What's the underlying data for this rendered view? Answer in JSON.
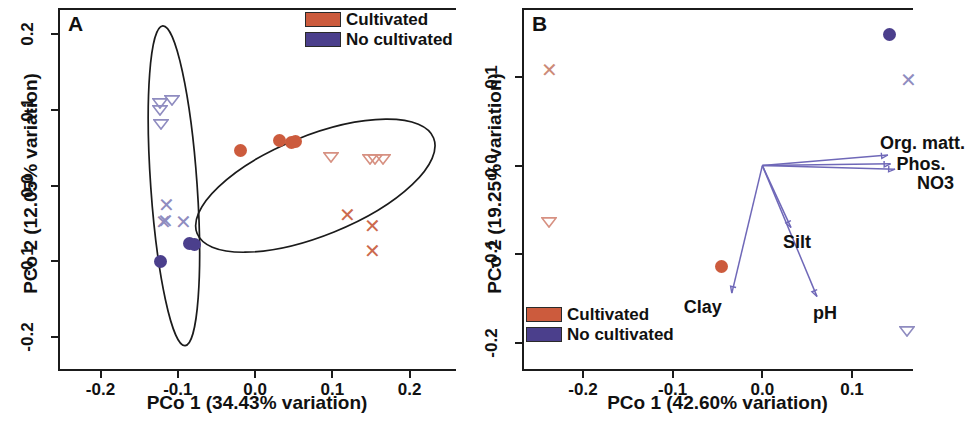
{
  "figure": {
    "title": "",
    "panels": [
      "A",
      "B"
    ],
    "colors": {
      "cultivated": "#cc5b3d",
      "no_cultivated": "#4b3f8c",
      "cultivated_light": "#d79182",
      "no_cultivated_light": "#8f8cc0",
      "axis": "#1b1b1b",
      "vector": "#6f68b8"
    }
  },
  "panel_a": {
    "letter": "A",
    "legend": [
      {
        "label": "Cultivated",
        "color": "#cc5b3d"
      },
      {
        "label": "No cultivated",
        "color": "#4b3f8c"
      }
    ],
    "xaxis": {
      "title": "PCo 1 (34.43% variation)",
      "ticks": [
        "-0.2",
        "-0.1",
        "0.0",
        "0.1",
        "0.2"
      ],
      "values": [
        -0.2,
        -0.1,
        0.0,
        0.1,
        0.2
      ],
      "min": -0.255,
      "max": 0.26
    },
    "yaxis": {
      "title": "PCo 2 (12.05% variation)",
      "ticks": [
        "0.2",
        "0.1",
        "0.0",
        "-0.1",
        "-0.2"
      ],
      "values": [
        0.2,
        0.1,
        0.0,
        -0.1,
        -0.2
      ],
      "min": -0.245,
      "max": 0.235
    }
  },
  "panel_b": {
    "letter": "B",
    "legend": [
      {
        "label": "Cultivated",
        "color": "#cc5b3d"
      },
      {
        "label": "No cultivated",
        "color": "#4b3f8c"
      }
    ],
    "xaxis": {
      "title": "PCo 1 (42.60% variation)",
      "ticks": [
        "-0.2",
        "-0.1",
        "0.0",
        "0.1"
      ],
      "values": [
        -0.2,
        -0.1,
        0.0,
        0.1
      ],
      "min": -0.268,
      "max": 0.168
    },
    "yaxis": {
      "title": "PCo 2 (19.25% variation)",
      "ticks": [
        "0.1",
        "0.0",
        "-0.1",
        "-0.2"
      ],
      "values": [
        0.1,
        0.0,
        -0.1,
        -0.2
      ],
      "min": -0.232,
      "max": 0.178
    },
    "vector_labels": [
      "Org. matt.",
      "Phos.",
      "NO3",
      "Silt",
      "pH",
      "Clay"
    ]
  },
  "chart_data": [
    {
      "type": "scatter",
      "panel": "A",
      "title": "",
      "xlabel": "PCo 1 (34.43% variation)",
      "ylabel": "PCo 2 (12.05% variation)",
      "xlim": [
        -0.255,
        0.26
      ],
      "ylim": [
        -0.245,
        0.235
      ],
      "grid": false,
      "legend_position": "top-right",
      "legend": [
        "Cultivated",
        "No cultivated"
      ],
      "series": [
        {
          "name": "No cultivated - triangle",
          "group": "No cultivated",
          "marker": "triangle-down-open",
          "color": "#8f8cc0",
          "points": [
            {
              "x": -0.122,
              "y": 0.108
            },
            {
              "x": -0.122,
              "y": 0.098
            },
            {
              "x": -0.121,
              "y": 0.079
            },
            {
              "x": -0.106,
              "y": 0.112
            }
          ]
        },
        {
          "name": "No cultivated - cross",
          "group": "No cultivated",
          "marker": "x",
          "color": "#8f8cc0",
          "points": [
            {
              "x": -0.115,
              "y": -0.025
            },
            {
              "x": -0.118,
              "y": -0.048
            },
            {
              "x": -0.116,
              "y": -0.046
            },
            {
              "x": -0.093,
              "y": -0.048
            }
          ]
        },
        {
          "name": "No cultivated - circle",
          "group": "No cultivated",
          "marker": "circle-filled",
          "color": "#4b3f8c",
          "points": [
            {
              "x": -0.085,
              "y": -0.076
            },
            {
              "x": -0.079,
              "y": -0.078
            },
            {
              "x": -0.122,
              "y": -0.1
            }
          ]
        },
        {
          "name": "Cultivated - circle",
          "group": "Cultivated",
          "marker": "circle-filled",
          "color": "#cc5b3d",
          "points": [
            {
              "x": -0.019,
              "y": 0.047
            },
            {
              "x": 0.032,
              "y": 0.06
            },
            {
              "x": 0.047,
              "y": 0.057
            },
            {
              "x": 0.052,
              "y": 0.059
            }
          ]
        },
        {
          "name": "Cultivated - triangle",
          "group": "Cultivated",
          "marker": "triangle-down-open",
          "color": "#d79182",
          "points": [
            {
              "x": 0.1,
              "y": 0.036
            },
            {
              "x": 0.15,
              "y": 0.033
            },
            {
              "x": 0.156,
              "y": 0.034
            },
            {
              "x": 0.167,
              "y": 0.034
            }
          ]
        },
        {
          "name": "Cultivated - cross",
          "group": "Cultivated",
          "marker": "x",
          "color": "#cc6a4e",
          "points": [
            {
              "x": 0.12,
              "y": -0.039
            },
            {
              "x": 0.152,
              "y": -0.053
            },
            {
              "x": 0.152,
              "y": -0.086
            }
          ]
        }
      ],
      "ellipses": [
        {
          "name": "no-cultivated-cluster",
          "cx": -0.105,
          "cy": 0.0,
          "rx": 0.03,
          "ry": 0.212,
          "rotation": -4
        },
        {
          "name": "cultivated-cluster",
          "cx": 0.078,
          "cy": 0.0,
          "rx": 0.165,
          "ry": 0.066,
          "rotation": -22
        }
      ]
    },
    {
      "type": "scatter",
      "panel": "B",
      "title": "",
      "xlabel": "PCo 1 (42.60% variation)",
      "ylabel": "PCo 2 (19.25% variation)",
      "xlim": [
        -0.268,
        0.168
      ],
      "ylim": [
        -0.232,
        0.178
      ],
      "grid": false,
      "legend_position": "bottom-left",
      "legend": [
        "Cultivated",
        "No cultivated"
      ],
      "series": [
        {
          "name": "No cultivated - circle",
          "group": "No cultivated",
          "marker": "circle-filled",
          "color": "#4b3f8c",
          "points": [
            {
              "x": 0.142,
              "y": 0.148
            }
          ]
        },
        {
          "name": "No cultivated - cross",
          "group": "No cultivated",
          "marker": "x",
          "color": "#8f8cc0",
          "points": [
            {
              "x": 0.163,
              "y": 0.097
            }
          ]
        },
        {
          "name": "No cultivated - triangle",
          "group": "No cultivated",
          "marker": "triangle-down-open",
          "color": "#8f8cc0",
          "points": [
            {
              "x": 0.162,
              "y": -0.188
            }
          ]
        },
        {
          "name": "Cultivated - cross",
          "group": "Cultivated",
          "marker": "x",
          "color": "#cc8a78",
          "points": [
            {
              "x": -0.237,
              "y": 0.108
            }
          ]
        },
        {
          "name": "Cultivated - triangle",
          "group": "Cultivated",
          "marker": "triangle-down-open",
          "color": "#d79182",
          "points": [
            {
              "x": -0.237,
              "y": -0.065
            }
          ]
        },
        {
          "name": "Cultivated - circle",
          "group": "Cultivated",
          "marker": "circle-filled",
          "color": "#cc5b3d",
          "points": [
            {
              "x": -0.046,
              "y": -0.114
            }
          ]
        }
      ],
      "vectors": {
        "origin": {
          "x": 0.0,
          "y": 0.0
        },
        "arrows": [
          {
            "label": "Org. matt.",
            "x": 0.14,
            "y": 0.012
          },
          {
            "label": "Phos.",
            "x": 0.143,
            "y": 0.002
          },
          {
            "label": "NO3",
            "x": 0.148,
            "y": -0.004
          },
          {
            "label": "Silt",
            "x": 0.032,
            "y": -0.07
          },
          {
            "label": "pH",
            "x": 0.061,
            "y": -0.148
          },
          {
            "label": "Clay",
            "x": -0.034,
            "y": -0.144
          }
        ]
      }
    }
  ]
}
